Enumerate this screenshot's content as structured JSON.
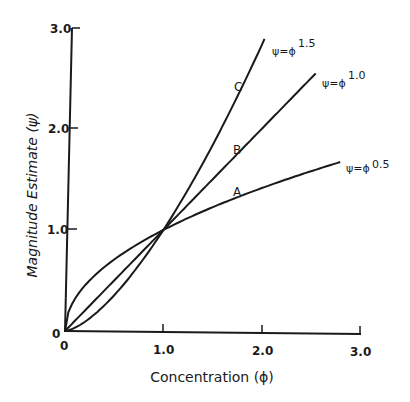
{
  "chart_data": {
    "type": "line",
    "title": "",
    "xlabel": "Concentration (ϕ)",
    "ylabel": "Magnitude Estimate (ψ)",
    "xlim": [
      0,
      3.0
    ],
    "ylim": [
      0,
      3.0
    ],
    "grid": false,
    "legend_position": "inline labels at curve ends",
    "x_ticks": [
      "0",
      "1.0",
      "2.0",
      "3.0"
    ],
    "y_ticks": [
      "0",
      "1.0",
      "2.0",
      "3.0"
    ],
    "series": [
      {
        "name": "A",
        "equation_base": "ψ=ϕ",
        "exponent": "0.5",
        "exponent_value": 0.5,
        "x": [
          0,
          0.05,
          0.1,
          0.25,
          0.5,
          0.75,
          1.0,
          1.5,
          2.0,
          2.5,
          2.8
        ],
        "values": [
          0,
          0.22,
          0.32,
          0.5,
          0.71,
          0.87,
          1.0,
          1.22,
          1.41,
          1.58,
          1.67
        ],
        "x_end": 2.8,
        "label_pos": {
          "x": 1.75,
          "y": 1.38
        }
      },
      {
        "name": "B",
        "equation_base": "ψ=ϕ",
        "exponent": "1.0",
        "exponent_value": 1.0,
        "x": [
          0,
          0.5,
          1.0,
          1.5,
          2.0,
          2.5
        ],
        "values": [
          0,
          0.5,
          1.0,
          1.5,
          2.0,
          2.5
        ],
        "x_end": 2.55,
        "label_pos": {
          "x": 1.75,
          "y": 1.8
        }
      },
      {
        "name": "C",
        "equation_base": "ψ=ϕ",
        "exponent": "1.5",
        "exponent_value": 1.5,
        "x": [
          0,
          0.25,
          0.5,
          0.75,
          1.0,
          1.25,
          1.5,
          1.75,
          2.0
        ],
        "values": [
          0,
          0.13,
          0.35,
          0.65,
          1.0,
          1.4,
          1.84,
          2.32,
          2.83
        ],
        "x_end": 2.03,
        "label_pos": {
          "x": 1.76,
          "y": 2.42
        }
      }
    ],
    "annotations": [
      "A",
      "B",
      "C",
      "ψ=ϕ 0.5",
      "ψ=ϕ 1.0",
      "ψ=ϕ 1.5"
    ]
  },
  "axes": {
    "x_title": "Concentration (ϕ)",
    "y_title": "Magnitude Estimate (ψ)",
    "origin_x_label": "0",
    "origin_y_label": "0",
    "x_tick_labels": [
      "1.0",
      "2.0",
      "3.0"
    ],
    "y_tick_labels": [
      "1.0",
      "2.0",
      "3.0"
    ]
  },
  "labels": {
    "curve_a": "A",
    "curve_b": "B",
    "curve_c": "C",
    "eq_a_base": "ψ=ϕ",
    "eq_a_exp": "0.5",
    "eq_b_base": "ψ=ϕ",
    "eq_b_exp": "1.0",
    "eq_c_base": "ψ=ϕ",
    "eq_c_exp": "1.5"
  }
}
